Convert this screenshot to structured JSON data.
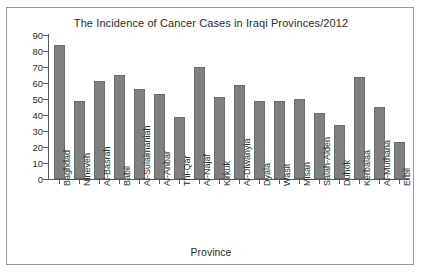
{
  "chart_data": {
    "type": "bar",
    "title": "The Incidence of Cancer Cases in Iraqi Provinces/2012",
    "xlabel": "Province",
    "ylabel": "Incidence Rate Per 100,000 Pop.",
    "ylim": [
      0,
      90
    ],
    "ytick_values": [
      0,
      10,
      20,
      30,
      40,
      50,
      60,
      70,
      80,
      90
    ],
    "grid": false,
    "legend": null,
    "bar_color": "#808080",
    "bar_edge_color": "#6b6b6b",
    "categories": [
      "Baghdad",
      "Nineveh",
      "Al-Basrah",
      "Babil",
      "Al-Sulaimaniah",
      "Al-Anbar",
      "Thi-Qar",
      "Al-Najaf",
      "Kirkuk",
      "Al-Diwanyia",
      "Dyala",
      "Wasit",
      "Misan",
      "Salah-Alden",
      "Duhok",
      "Kerbalaa",
      "Al-Muthana",
      "Erbil"
    ],
    "values": [
      84,
      49,
      61,
      65,
      56,
      53,
      39,
      70,
      51,
      59,
      49,
      49,
      50,
      41,
      34,
      64,
      45,
      23
    ]
  }
}
